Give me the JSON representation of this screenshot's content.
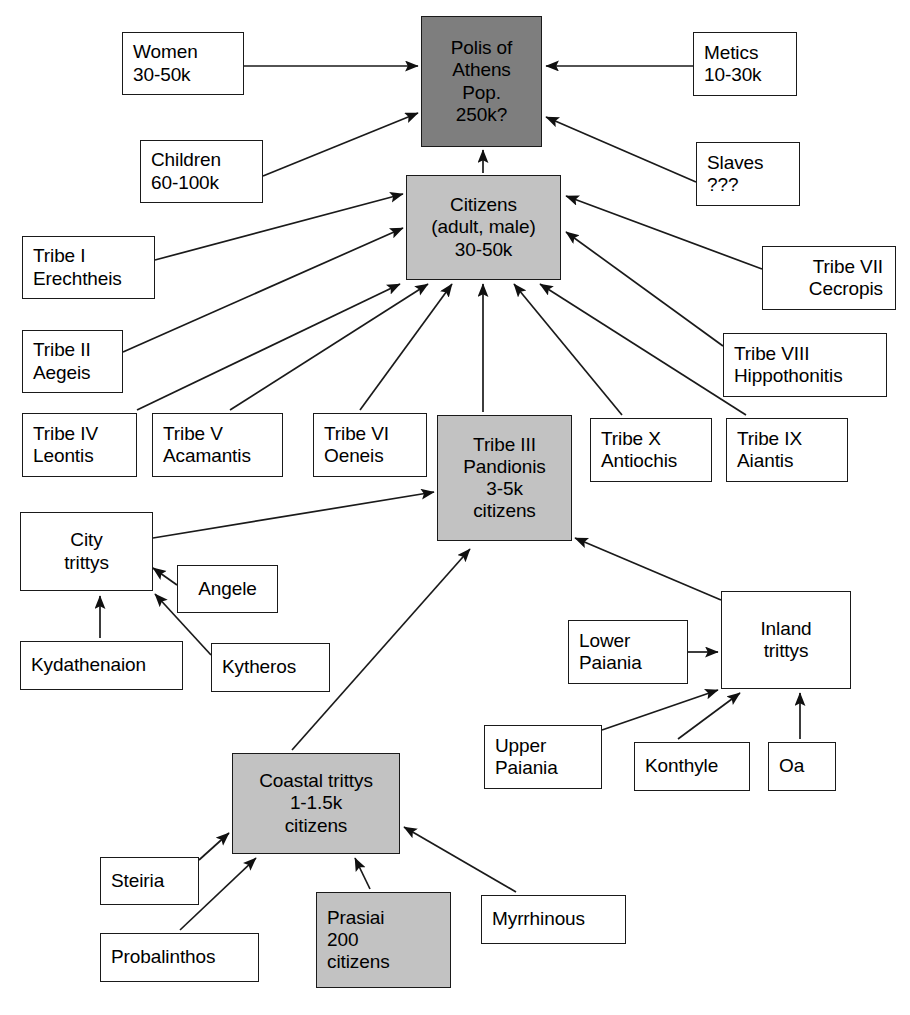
{
  "diagram": {
    "colors": {
      "dark_fill": "#7e7e7e",
      "gray_fill": "#c2c2c2",
      "white_fill": "#ffffff",
      "stroke": "#1a1a1a"
    },
    "nodes": [
      {
        "id": "polis",
        "lines": [
          "Polis of",
          "Athens",
          "Pop.",
          "250k?"
        ],
        "fill": "dark",
        "align": "center",
        "x": 421,
        "y": 16,
        "w": 121,
        "h": 131
      },
      {
        "id": "women",
        "lines": [
          "Women",
          "30-50k"
        ],
        "fill": "white",
        "align": "left",
        "x": 122,
        "y": 32,
        "w": 122,
        "h": 63
      },
      {
        "id": "metics",
        "lines": [
          "Metics",
          "10-30k"
        ],
        "fill": "white",
        "align": "left",
        "x": 693,
        "y": 32,
        "w": 104,
        "h": 64
      },
      {
        "id": "children",
        "lines": [
          "Children",
          "60-100k"
        ],
        "fill": "white",
        "align": "left",
        "x": 140,
        "y": 140,
        "w": 123,
        "h": 63
      },
      {
        "id": "slaves",
        "lines": [
          "Slaves",
          "???"
        ],
        "fill": "white",
        "align": "left",
        "x": 696,
        "y": 142,
        "w": 104,
        "h": 64
      },
      {
        "id": "citizens",
        "lines": [
          "Citizens",
          "(adult, male)",
          "30-50k"
        ],
        "fill": "gray",
        "align": "center",
        "x": 406,
        "y": 175,
        "w": 155,
        "h": 105
      },
      {
        "id": "tribe1",
        "lines": [
          "Tribe I",
          "Erechtheis"
        ],
        "fill": "white",
        "align": "left",
        "x": 22,
        "y": 236,
        "w": 133,
        "h": 63
      },
      {
        "id": "tribe7",
        "lines": [
          "Tribe VII",
          "Cecropis"
        ],
        "fill": "white",
        "align": "right",
        "x": 762,
        "y": 246,
        "w": 134,
        "h": 64
      },
      {
        "id": "tribe2",
        "lines": [
          "Tribe II",
          "Aegeis"
        ],
        "fill": "white",
        "align": "left",
        "x": 22,
        "y": 330,
        "w": 101,
        "h": 63
      },
      {
        "id": "tribe8",
        "lines": [
          "Tribe VIII",
          "Hippothonitis"
        ],
        "fill": "white",
        "align": "left",
        "x": 723,
        "y": 333,
        "w": 164,
        "h": 64
      },
      {
        "id": "tribe4",
        "lines": [
          "Tribe IV",
          "Leontis"
        ],
        "fill": "white",
        "align": "left",
        "x": 22,
        "y": 413,
        "w": 115,
        "h": 64
      },
      {
        "id": "tribe5",
        "lines": [
          "Tribe V",
          "Acamantis"
        ],
        "fill": "white",
        "align": "left",
        "x": 152,
        "y": 413,
        "w": 131,
        "h": 64
      },
      {
        "id": "tribe6",
        "lines": [
          "Tribe VI",
          "Oeneis"
        ],
        "fill": "white",
        "align": "left",
        "x": 313,
        "y": 413,
        "w": 114,
        "h": 64
      },
      {
        "id": "tribe3",
        "lines": [
          "Tribe III",
          "Pandionis",
          "3-5k",
          "citizens"
        ],
        "fill": "gray",
        "align": "center",
        "x": 437,
        "y": 415,
        "w": 135,
        "h": 126
      },
      {
        "id": "tribe10",
        "lines": [
          "Tribe X",
          "Antiochis"
        ],
        "fill": "white",
        "align": "left",
        "x": 590,
        "y": 418,
        "w": 122,
        "h": 64
      },
      {
        "id": "tribe9",
        "lines": [
          "Tribe IX",
          "Aiantis"
        ],
        "fill": "white",
        "align": "left",
        "x": 726,
        "y": 418,
        "w": 122,
        "h": 64
      },
      {
        "id": "citytrittys",
        "lines": [
          "City",
          "trittys"
        ],
        "fill": "white",
        "align": "center",
        "x": 20,
        "y": 512,
        "w": 133,
        "h": 79
      },
      {
        "id": "angele",
        "lines": [
          "Angele"
        ],
        "fill": "white",
        "align": "center",
        "x": 177,
        "y": 565,
        "w": 101,
        "h": 48
      },
      {
        "id": "inland",
        "lines": [
          "Inland",
          "trittys"
        ],
        "fill": "white",
        "align": "center",
        "x": 721,
        "y": 591,
        "w": 130,
        "h": 98
      },
      {
        "id": "lowerpaiania",
        "lines": [
          "Lower",
          "Paiania"
        ],
        "fill": "white",
        "align": "left",
        "x": 568,
        "y": 620,
        "w": 120,
        "h": 64
      },
      {
        "id": "kydathenaion",
        "lines": [
          "Kydathenaion"
        ],
        "fill": "white",
        "align": "left",
        "x": 20,
        "y": 641,
        "w": 163,
        "h": 49
      },
      {
        "id": "kytheros",
        "lines": [
          "Kytheros"
        ],
        "fill": "white",
        "align": "left",
        "x": 211,
        "y": 643,
        "w": 119,
        "h": 49
      },
      {
        "id": "upperpaiania",
        "lines": [
          "Upper",
          "Paiania"
        ],
        "fill": "white",
        "align": "left",
        "x": 484,
        "y": 725,
        "w": 118,
        "h": 64
      },
      {
        "id": "konthyle",
        "lines": [
          "Konthyle"
        ],
        "fill": "white",
        "align": "left",
        "x": 634,
        "y": 742,
        "w": 116,
        "h": 49
      },
      {
        "id": "oa",
        "lines": [
          "Oa"
        ],
        "fill": "white",
        "align": "left",
        "x": 768,
        "y": 742,
        "w": 68,
        "h": 49
      },
      {
        "id": "coastal",
        "lines": [
          "Coastal trittys",
          "1-1.5k",
          "citizens"
        ],
        "fill": "gray",
        "align": "center",
        "x": 232,
        "y": 753,
        "w": 168,
        "h": 101
      },
      {
        "id": "steiria",
        "lines": [
          "Steiria"
        ],
        "fill": "white",
        "align": "left",
        "x": 100,
        "y": 857,
        "w": 99,
        "h": 48
      },
      {
        "id": "myrrhinous",
        "lines": [
          "Myrrhinous"
        ],
        "fill": "white",
        "align": "left",
        "x": 481,
        "y": 895,
        "w": 145,
        "h": 49
      },
      {
        "id": "prasiai",
        "lines": [
          "Prasiai",
          "200",
          "citizens"
        ],
        "fill": "gray",
        "align": "left",
        "x": 316,
        "y": 892,
        "w": 135,
        "h": 96
      },
      {
        "id": "probalinthos",
        "lines": [
          "Probalinthos"
        ],
        "fill": "white",
        "align": "left",
        "x": 100,
        "y": 933,
        "w": 159,
        "h": 49
      }
    ],
    "edges": [
      {
        "from": "women",
        "to": "polis",
        "label": "women-to-polis"
      },
      {
        "from": "metics",
        "to": "polis",
        "label": "metics-to-polis"
      },
      {
        "from": "children",
        "to": "polis",
        "label": "children-to-polis"
      },
      {
        "from": "slaves",
        "to": "polis",
        "label": "slaves-to-polis"
      },
      {
        "from": "citizens",
        "to": "polis",
        "label": "citizens-to-polis"
      },
      {
        "from": "tribe1",
        "to": "citizens",
        "label": "tribe1-to-citizens"
      },
      {
        "from": "tribe2",
        "to": "citizens",
        "label": "tribe2-to-citizens"
      },
      {
        "from": "tribe4",
        "to": "citizens",
        "label": "tribe4-to-citizens"
      },
      {
        "from": "tribe5",
        "to": "citizens",
        "label": "tribe5-to-citizens"
      },
      {
        "from": "tribe6",
        "to": "citizens",
        "label": "tribe6-to-citizens"
      },
      {
        "from": "tribe3",
        "to": "citizens",
        "label": "tribe3-to-citizens"
      },
      {
        "from": "tribe10",
        "to": "citizens",
        "label": "tribe10-to-citizens"
      },
      {
        "from": "tribe9",
        "to": "citizens",
        "label": "tribe9-to-citizens"
      },
      {
        "from": "tribe8",
        "to": "citizens",
        "label": "tribe8-to-citizens"
      },
      {
        "from": "tribe7",
        "to": "citizens",
        "label": "tribe7-to-citizens"
      },
      {
        "from": "citytrittys",
        "to": "tribe3",
        "label": "citytrittys-to-tribe3"
      },
      {
        "from": "inland",
        "to": "tribe3",
        "label": "inland-to-tribe3"
      },
      {
        "from": "coastal",
        "to": "tribe3",
        "label": "coastal-to-tribe3"
      },
      {
        "from": "angele",
        "to": "citytrittys",
        "label": "angele-to-citytrittys"
      },
      {
        "from": "kytheros",
        "to": "citytrittys",
        "label": "kytheros-to-citytrittys"
      },
      {
        "from": "kydathenaion",
        "to": "citytrittys",
        "label": "kydathenaion-to-citytrittys"
      },
      {
        "from": "lowerpaiania",
        "to": "inland",
        "label": "lowerpaiania-to-inland"
      },
      {
        "from": "upperpaiania",
        "to": "inland",
        "label": "upperpaiania-to-inland"
      },
      {
        "from": "konthyle",
        "to": "inland",
        "label": "konthyle-to-inland"
      },
      {
        "from": "oa",
        "to": "inland",
        "label": "oa-to-inland"
      },
      {
        "from": "steiria",
        "to": "coastal",
        "label": "steiria-to-coastal"
      },
      {
        "from": "probalinthos",
        "to": "coastal",
        "label": "probalinthos-to-coastal"
      },
      {
        "from": "prasiai",
        "to": "coastal",
        "label": "prasiai-to-coastal"
      },
      {
        "from": "myrrhinous",
        "to": "coastal",
        "label": "myrrhinous-to-coastal"
      }
    ],
    "edge_geometry": [
      {
        "x1": 244,
        "y1": 66,
        "x2": 418,
        "y2": 66
      },
      {
        "x1": 693,
        "y1": 66,
        "x2": 546,
        "y2": 66
      },
      {
        "x1": 263,
        "y1": 176,
        "x2": 418,
        "y2": 113
      },
      {
        "x1": 696,
        "y1": 182,
        "x2": 546,
        "y2": 117
      },
      {
        "x1": 483,
        "y1": 173,
        "x2": 483,
        "y2": 150
      },
      {
        "x1": 155,
        "y1": 260,
        "x2": 403,
        "y2": 194
      },
      {
        "x1": 123,
        "y1": 352,
        "x2": 403,
        "y2": 228
      },
      {
        "x1": 137,
        "y1": 410,
        "x2": 400,
        "y2": 284
      },
      {
        "x1": 230,
        "y1": 410,
        "x2": 428,
        "y2": 284
      },
      {
        "x1": 360,
        "y1": 410,
        "x2": 452,
        "y2": 284
      },
      {
        "x1": 483,
        "y1": 412,
        "x2": 483,
        "y2": 284
      },
      {
        "x1": 622,
        "y1": 415,
        "x2": 514,
        "y2": 284
      },
      {
        "x1": 746,
        "y1": 415,
        "x2": 540,
        "y2": 284
      },
      {
        "x1": 723,
        "y1": 346,
        "x2": 566,
        "y2": 232
      },
      {
        "x1": 762,
        "y1": 269,
        "x2": 566,
        "y2": 196
      },
      {
        "x1": 153,
        "y1": 538,
        "x2": 434,
        "y2": 492
      },
      {
        "x1": 721,
        "y1": 600,
        "x2": 575,
        "y2": 538
      },
      {
        "x1": 292,
        "y1": 750,
        "x2": 470,
        "y2": 549
      },
      {
        "x1": 177,
        "y1": 585,
        "x2": 153,
        "y2": 568
      },
      {
        "x1": 211,
        "y1": 655,
        "x2": 155,
        "y2": 594
      },
      {
        "x1": 100,
        "y1": 638,
        "x2": 100,
        "y2": 596
      },
      {
        "x1": 688,
        "y1": 652,
        "x2": 718,
        "y2": 652
      },
      {
        "x1": 602,
        "y1": 730,
        "x2": 718,
        "y2": 690
      },
      {
        "x1": 678,
        "y1": 739,
        "x2": 740,
        "y2": 693
      },
      {
        "x1": 800,
        "y1": 739,
        "x2": 800,
        "y2": 693
      },
      {
        "x1": 199,
        "y1": 860,
        "x2": 229,
        "y2": 833
      },
      {
        "x1": 180,
        "y1": 930,
        "x2": 256,
        "y2": 858
      },
      {
        "x1": 370,
        "y1": 889,
        "x2": 355,
        "y2": 858
      },
      {
        "x1": 516,
        "y1": 892,
        "x2": 404,
        "y2": 827
      }
    ],
    "caption": ""
  }
}
